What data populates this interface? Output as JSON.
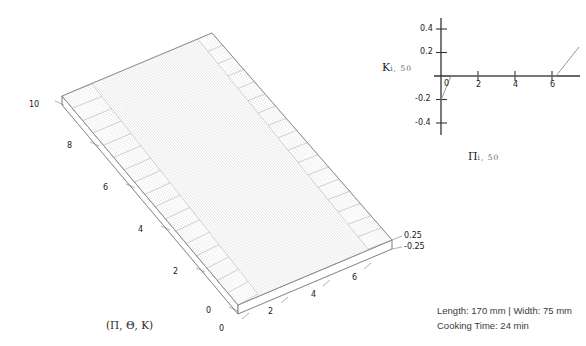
{
  "figure": {
    "background_color": "#ffffff",
    "line_color": "#555555",
    "mesh_color": "#b8b8b8",
    "text_color": "#1a1a1a"
  },
  "surface_plot": {
    "name": "3d-surface-plot",
    "caption": "(Π, Θ, K)",
    "caption_parts": [
      "Π",
      "Θ",
      "K"
    ],
    "axis_left": {
      "name": "theta-axis",
      "ticks": [
        "0",
        "2",
        "4",
        "6",
        "8",
        "10"
      ],
      "values": [
        0,
        2,
        4,
        6,
        8,
        10
      ],
      "range": [
        0,
        10
      ]
    },
    "axis_bottom": {
      "name": "pi-axis",
      "ticks": [
        "0",
        "2",
        "4",
        "6"
      ],
      "values": [
        0,
        2,
        4,
        6
      ],
      "range": [
        0,
        7
      ]
    },
    "axis_vertical": {
      "name": "k-axis",
      "ticks": [
        "0.25",
        "-0.25"
      ],
      "values": [
        0.25,
        -0.25
      ],
      "range": [
        -0.25,
        0.25
      ]
    },
    "description": "Flat ruled mesh surface with raised dotted corrugation bands along both long edges"
  },
  "line_plot": {
    "name": "k-vs-pi-plot",
    "y_axis_label": "K",
    "y_axis_sub": "i, 50",
    "x_axis_label": "Π",
    "x_axis_sub": "i, 50",
    "y_ticks": [
      "0.4",
      "0.2",
      "-0.2",
      "-0.4"
    ],
    "y_tick_values": [
      0.4,
      0.2,
      -0.2,
      -0.4
    ],
    "x_ticks": [
      "0",
      "2",
      "4",
      "6"
    ],
    "x_tick_values": [
      0,
      2,
      4,
      6
    ],
    "y_range": [
      -0.5,
      0.5
    ],
    "x_range": [
      -0.6,
      7.6
    ]
  },
  "chart_data": {
    "type": "line",
    "title": "",
    "xlabel": "Π i, 50",
    "ylabel": "K i, 50",
    "xlim": [
      -0.6,
      7.6
    ],
    "ylim": [
      -0.5,
      0.5
    ],
    "grid": false,
    "legend": "none",
    "series": [
      {
        "name": "K_i,50",
        "x": [
          0.0,
          0.55,
          6.2,
          7.45
        ],
        "y": [
          -0.2,
          0.0,
          0.0,
          0.25
        ]
      }
    ],
    "x_ticks": [
      0,
      2,
      4,
      6
    ],
    "y_ticks": [
      -0.4,
      -0.2,
      0.2,
      0.4
    ]
  },
  "info": {
    "name": "specimen-info",
    "line1": "Length: 170 mm | Width: 75 mm",
    "line2": "Cooking Time: 24 min",
    "length": "170 mm",
    "width": "75 mm",
    "cooking_time": "24 min"
  }
}
